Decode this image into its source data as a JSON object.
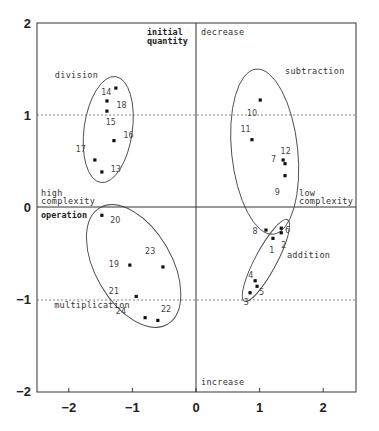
{
  "chart_data": {
    "type": "scatter",
    "title": "",
    "xlabel": "",
    "ylabel": "",
    "xlim": [
      -2.5,
      2.5
    ],
    "ylim": [
      -2,
      2
    ],
    "x_ticks": [
      -2,
      -1,
      0,
      1,
      2
    ],
    "y_ticks": [
      2,
      1,
      0,
      -1,
      -2
    ],
    "grid": false,
    "reference_lines": {
      "dotted_y": [
        1,
        -1
      ],
      "solid_x": [
        0
      ],
      "solid_y": [
        0
      ]
    },
    "axis_annotations": {
      "top": "decrease",
      "bottom": "increase",
      "left_top": "high complexity",
      "right": "low complexity",
      "upper_axis_label": "initial quantity",
      "lower_axis_label": "operation"
    },
    "groups": [
      {
        "name": "division",
        "points": [
          13,
          14,
          15,
          16,
          17,
          18
        ],
        "ellipse": {
          "cx": -1.38,
          "cy": 0.84,
          "rx": 0.38,
          "ry": 0.58,
          "rot": 8
        }
      },
      {
        "name": "subtraction",
        "points": [
          7,
          9,
          10,
          11,
          12
        ],
        "ellipse": {
          "cx": 1.08,
          "cy": 0.6,
          "rx": 0.52,
          "ry": 0.9,
          "rot": -6
        }
      },
      {
        "name": "addition",
        "points": [
          1,
          2,
          3,
          4,
          5,
          6,
          8
        ],
        "ellipse": {
          "cx": 1.1,
          "cy": -0.58,
          "rx": 0.17,
          "ry": 0.5,
          "rot": 28
        }
      },
      {
        "name": "multiplication",
        "points": [
          19,
          20,
          21,
          22,
          23,
          24
        ],
        "ellipse": {
          "cx": -0.98,
          "cy": -0.64,
          "rx": 0.6,
          "ry": 0.73,
          "rot": -30
        }
      }
    ],
    "series": [
      {
        "id": "1",
        "x": 1.21,
        "y": -0.34
      },
      {
        "id": "2",
        "x": 1.34,
        "y": -0.28
      },
      {
        "id": "3",
        "x": 0.85,
        "y": -0.93
      },
      {
        "id": "4",
        "x": 0.93,
        "y": -0.8
      },
      {
        "id": "5",
        "x": 0.96,
        "y": -0.86
      },
      {
        "id": "6",
        "x": 1.34,
        "y": -0.23
      },
      {
        "id": "7",
        "x": 1.37,
        "y": 0.51
      },
      {
        "id": "8",
        "x": 1.1,
        "y": -0.25
      },
      {
        "id": "9",
        "x": 1.4,
        "y": 0.34
      },
      {
        "id": "10",
        "x": 1.01,
        "y": 1.16
      },
      {
        "id": "11",
        "x": 0.88,
        "y": 0.73
      },
      {
        "id": "12",
        "x": 1.4,
        "y": 0.47
      },
      {
        "id": "13",
        "x": -1.48,
        "y": 0.38
      },
      {
        "id": "14",
        "x": -1.26,
        "y": 1.29
      },
      {
        "id": "15",
        "x": -1.4,
        "y": 1.04
      },
      {
        "id": "16",
        "x": -1.29,
        "y": 0.72
      },
      {
        "id": "17",
        "x": -1.59,
        "y": 0.51
      },
      {
        "id": "18",
        "x": -1.4,
        "y": 1.15
      },
      {
        "id": "19",
        "x": -1.04,
        "y": -0.63
      },
      {
        "id": "20",
        "x": -1.48,
        "y": -0.09
      },
      {
        "id": "21",
        "x": -0.94,
        "y": -0.97
      },
      {
        "id": "22",
        "x": -0.6,
        "y": -1.23
      },
      {
        "id": "23",
        "x": -0.52,
        "y": -0.65
      },
      {
        "id": "24",
        "x": -0.8,
        "y": -1.2
      }
    ],
    "point_labels": [
      {
        "id": "1",
        "x": 1.15,
        "y": -0.47
      },
      {
        "id": "2",
        "x": 1.34,
        "y": -0.41
      },
      {
        "id": "3",
        "x": 0.75,
        "y": -1.03
      },
      {
        "id": "4",
        "x": 0.82,
        "y": -0.74
      },
      {
        "id": "5",
        "x": 0.99,
        "y": -0.92
      },
      {
        "id": "6",
        "x": 1.4,
        "y": -0.25
      },
      {
        "id": "7",
        "x": 1.18,
        "y": 0.52
      },
      {
        "id": "8",
        "x": 0.89,
        "y": -0.26
      },
      {
        "id": "9",
        "x": 1.24,
        "y": 0.16
      },
      {
        "id": "10",
        "x": 0.8,
        "y": 1.02
      },
      {
        "id": "11",
        "x": 0.7,
        "y": 0.85
      },
      {
        "id": "12",
        "x": 1.33,
        "y": 0.61
      },
      {
        "id": "13",
        "x": -1.34,
        "y": 0.41
      },
      {
        "id": "14",
        "x": -1.49,
        "y": 1.25
      },
      {
        "id": "15",
        "x": -1.42,
        "y": 0.92
      },
      {
        "id": "16",
        "x": -1.14,
        "y": 0.78
      },
      {
        "id": "17",
        "x": -1.89,
        "y": 0.63
      },
      {
        "id": "18",
        "x": -1.25,
        "y": 1.11
      },
      {
        "id": "19",
        "x": -1.37,
        "y": -0.62
      },
      {
        "id": "20",
        "x": -1.35,
        "y": -0.14
      },
      {
        "id": "21",
        "x": -1.37,
        "y": -0.91
      },
      {
        "id": "22",
        "x": -0.55,
        "y": -1.11
      },
      {
        "id": "23",
        "x": -0.8,
        "y": -0.48
      },
      {
        "id": "24",
        "x": -1.26,
        "y": -1.13
      }
    ],
    "group_labels": [
      {
        "text": "division",
        "x": -2.22,
        "y": 1.4
      },
      {
        "text": "subtraction",
        "x": 1.4,
        "y": 1.44
      },
      {
        "text": "addition",
        "x": 1.43,
        "y": -0.55
      },
      {
        "text": "multiplication",
        "x": -2.23,
        "y": -1.1
      }
    ]
  },
  "labels": {
    "decrease": "decrease",
    "increase": "increase",
    "initial_quantity_1": "initial",
    "initial_quantity_2": "quantity",
    "high_complexity_1": "high",
    "high_complexity_2": "complexity",
    "low_complexity_1": "low",
    "low_complexity_2": "complexity",
    "operation": "operation"
  }
}
